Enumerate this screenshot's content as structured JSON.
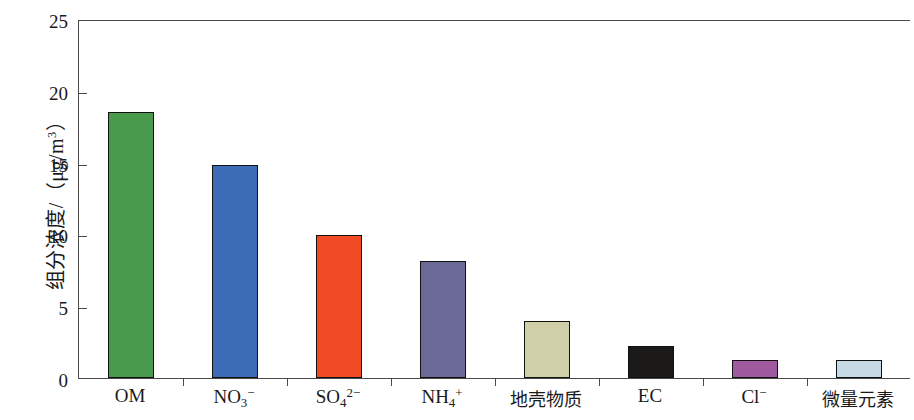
{
  "chart_data": {
    "type": "bar",
    "title": "",
    "xlabel": "",
    "ylabel": "组分浓度/（μg/m³）",
    "ylabel_parts": {
      "prefix": "组分浓度/（",
      "unit_mu": "μ",
      "unit_gm": "g/m",
      "unit_exp": "3",
      "suffix": "）"
    },
    "categories": [
      "OM",
      "NO3-",
      "SO42-",
      "NH4+",
      "地壳物质",
      "EC",
      "Cl-",
      "微量元素"
    ],
    "category_labels_html": [
      {
        "base": "OM",
        "sub": "",
        "sup": "",
        "cjk": false
      },
      {
        "base": "NO",
        "sub": "3",
        "sup": "−",
        "cjk": false
      },
      {
        "base": "SO",
        "sub": "4",
        "sup": "2−",
        "cjk": false
      },
      {
        "base": "NH",
        "sub": "4",
        "sup": "+",
        "cjk": false
      },
      {
        "base": "地壳物质",
        "sub": "",
        "sup": "",
        "cjk": true
      },
      {
        "base": "EC",
        "sub": "",
        "sup": "",
        "cjk": false
      },
      {
        "base": "Cl",
        "sub": "",
        "sup": "−",
        "cjk": false
      },
      {
        "base": "微量元素",
        "sub": "",
        "sup": "",
        "cjk": true
      }
    ],
    "values": [
      18.5,
      14.8,
      9.95,
      8.15,
      3.95,
      2.25,
      1.25,
      1.25
    ],
    "bar_colors": [
      "#4a9a4e",
      "#3b6cb5",
      "#f04b25",
      "#6b6a96",
      "#cfd0a8",
      "#1c1a18",
      "#a05ba0",
      "#c6dae6"
    ],
    "bar_edge_color": "#111111",
    "ylim": [
      0,
      25
    ],
    "yticks": [
      0,
      5,
      10,
      15,
      20,
      25
    ],
    "ytick_labels": [
      "0",
      "5",
      "10",
      "15",
      "20",
      "25"
    ],
    "grid": false,
    "legend": null,
    "axis_color": "#4a4a4a"
  }
}
